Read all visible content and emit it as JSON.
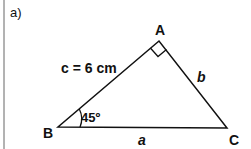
{
  "part_label": "a)",
  "triangle": {
    "vertices": [
      {
        "name": "A",
        "x": 159,
        "y": 41
      },
      {
        "name": "B",
        "x": 58,
        "y": 127
      },
      {
        "name": "C",
        "x": 227,
        "y": 128
      }
    ],
    "right_angle_at": "A",
    "sides": {
      "c": "c = 6 cm",
      "b": "b",
      "a": "a"
    },
    "angle_B": "45º"
  },
  "colors": {
    "stroke": "#111111",
    "margin_line": "#555555"
  }
}
